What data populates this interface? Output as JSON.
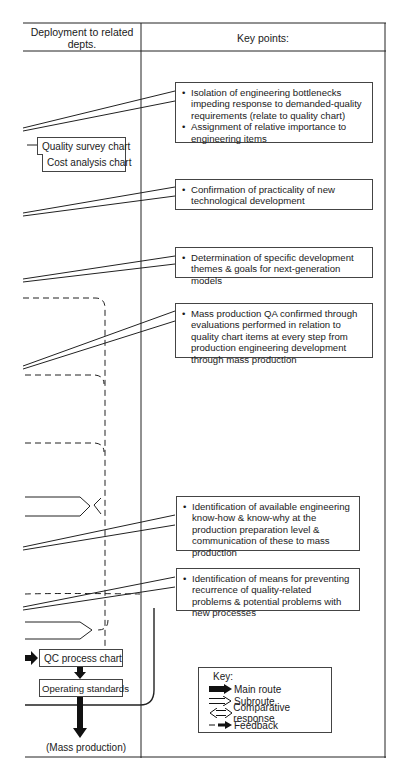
{
  "headers": {
    "left_column": "Deployment to related depts.",
    "right_column": "Key points:"
  },
  "key_points": [
    {
      "bullets": [
        "Isolation of engineering bottlenecks impeding response to demanded-quality requirements (relate to quality chart)",
        "Assignment of relative importance to engineering items"
      ]
    },
    {
      "bullets": [
        "Confirmation of practicality of new technological development"
      ]
    },
    {
      "bullets": [
        "Determination of specific development themes & goals for next-generation models"
      ]
    },
    {
      "bullets": [
        "Mass production QA confirmed through evaluations performed in relation to quality chart items at every step from production engineering development through mass production"
      ]
    },
    {
      "bullets": [
        "Identification of available engineering know-how & know-why at the production preparation level & communication of these to mass production"
      ]
    },
    {
      "bullets": [
        "Identification of means for preventing recurrence of quality-related problems & potential problems with new processes"
      ]
    }
  ],
  "documents": {
    "quality_survey_chart": "Quality survey chart",
    "cost_analysis_chart": "Cost analysis chart",
    "qc_process_chart": "QC process chart",
    "operating_standards": "Operating standards",
    "mass_production": "(Mass production)"
  },
  "legend": {
    "title": "Key:",
    "items": [
      {
        "icon": "main-route-arrow-icon",
        "label": "Main route"
      },
      {
        "icon": "subroute-arrow-icon",
        "label": "Subroute"
      },
      {
        "icon": "comparative-response-arrow-icon",
        "label": "Comparative response"
      },
      {
        "icon": "feedback-arrow-icon",
        "label": "Feedback"
      }
    ]
  },
  "colors": {
    "ink": "#1a1a1a",
    "paper": "#ffffff"
  }
}
